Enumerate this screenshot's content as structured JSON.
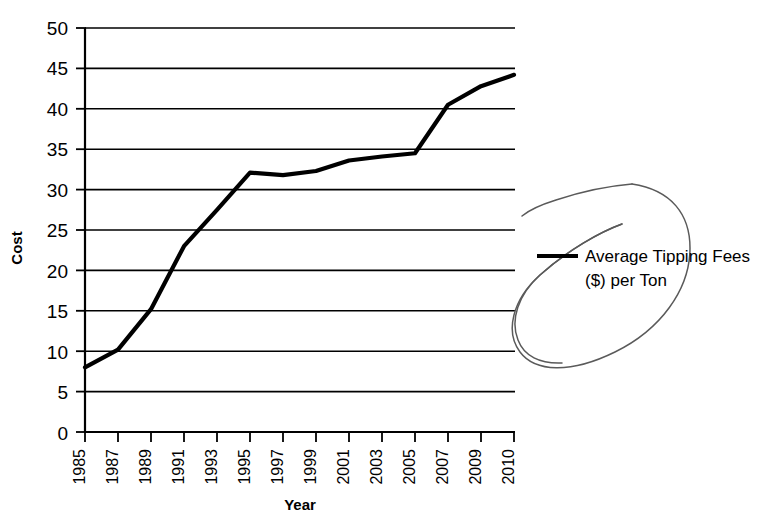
{
  "chart_data": {
    "type": "line",
    "title": "",
    "xlabel": "Year",
    "ylabel": "Cost",
    "xlim": [
      1985,
      2011
    ],
    "ylim": [
      0,
      50
    ],
    "grid": true,
    "legend_position": "right",
    "x_tick_labels": [
      "1985",
      "1987",
      "1989",
      "1991",
      "1993",
      "1995",
      "1997",
      "1999",
      "2001",
      "2003",
      "2005",
      "2007",
      "2009",
      "2010"
    ],
    "y_tick_labels": [
      "0",
      "5",
      "10",
      "15",
      "20",
      "25",
      "30",
      "35",
      "40",
      "45",
      "50"
    ],
    "y_ticks": [
      0,
      5,
      10,
      15,
      20,
      25,
      30,
      35,
      40,
      45,
      50
    ],
    "series": [
      {
        "name": "Average Tipping Fees ($) per Ton",
        "x": [
          1985,
          1987,
          1989,
          1991,
          1993,
          1995,
          1997,
          1999,
          2001,
          2003,
          2005,
          2007,
          2009,
          2010
        ],
        "values": [
          8.0,
          10.2,
          15.2,
          23.0,
          27.5,
          32.1,
          31.8,
          32.3,
          33.6,
          34.1,
          34.5,
          40.5,
          42.8,
          44.2
        ]
      }
    ]
  },
  "legend": {
    "entries": [
      {
        "line1": "Average Tipping Fees",
        "line2": "($) per Ton"
      }
    ]
  },
  "annotation": {
    "name": "hand-drawn-ellipse-highlight"
  }
}
